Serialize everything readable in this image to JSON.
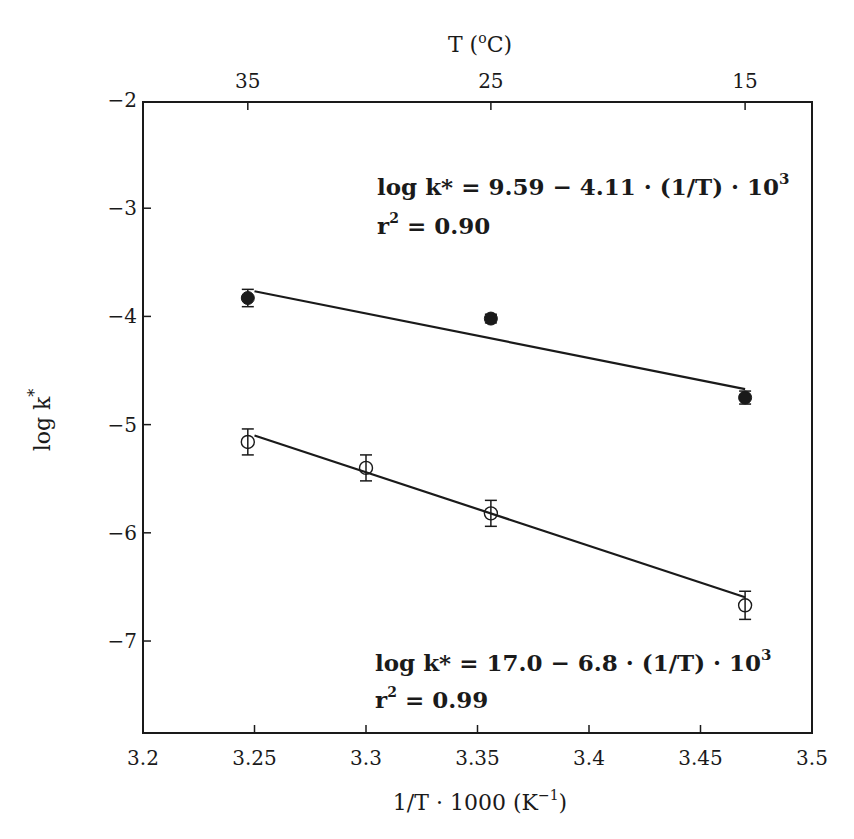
{
  "chart_data": {
    "type": "scatter",
    "title": "",
    "xlabel": "1/T · 1000 (K⁻¹)",
    "xlabel_parts": {
      "main": "1/T · 1000 (K",
      "sup": "−1",
      "tail": ")"
    },
    "ylabel": "log k*",
    "ylabel_parts": {
      "main": "log k",
      "sup": "*"
    },
    "top_xlabel": "T (°C)",
    "top_xlabel_parts": {
      "pre": "T (",
      "sup": "o",
      "post": "C)"
    },
    "xlim": [
      3.2,
      3.5
    ],
    "ylim": [
      -7.85,
      -2
    ],
    "grid": false,
    "x_ticks": [
      3.2,
      3.25,
      3.3,
      3.35,
      3.4,
      3.45,
      3.5
    ],
    "x_tick_labels": [
      "3.2",
      "3.25",
      "3.3",
      "3.35",
      "3.4",
      "3.45",
      "3.5"
    ],
    "y_ticks": [
      -2,
      -3,
      -4,
      -5,
      -6,
      -7
    ],
    "y_tick_labels": [
      "−2",
      "−3",
      "−4",
      "−5",
      "−6",
      "−7"
    ],
    "top_ticks": [
      {
        "x": 3.247,
        "label": "35"
      },
      {
        "x": 3.356,
        "label": "25"
      },
      {
        "x": 3.47,
        "label": "15"
      }
    ],
    "series": [
      {
        "name": "filled circles",
        "marker": "filled-circle",
        "x": [
          3.247,
          3.356,
          3.47
        ],
        "y": [
          -3.83,
          -4.02,
          -4.75
        ],
        "yerr": [
          0.08,
          0.04,
          0.06
        ],
        "fit": {
          "intercept": 9.59,
          "slope": -4.11,
          "r2": 0.9,
          "x_range": [
            3.25,
            3.47
          ]
        },
        "annotation": {
          "equation": "log  k* =  9.59  −  4.11 · (1/T) · 10",
          "equation_sup": "3",
          "r2_prefix": "r",
          "r2_sup": "2",
          "r2_value": " =  0.90"
        }
      },
      {
        "name": "open circles",
        "marker": "open-circle",
        "x": [
          3.247,
          3.3,
          3.356,
          3.47
        ],
        "y": [
          -5.16,
          -5.4,
          -5.82,
          -6.67
        ],
        "yerr": [
          0.12,
          0.12,
          0.12,
          0.13
        ],
        "fit": {
          "intercept": 17.0,
          "slope": -6.8,
          "r2": 0.99,
          "x_range": [
            3.25,
            3.47
          ]
        },
        "annotation": {
          "equation": "log  k* =  17.0  −  6.8   · (1/T) · 10",
          "equation_sup": "3",
          "r2_prefix": "r",
          "r2_sup": "2",
          "r2_value": " =  0.99"
        }
      }
    ],
    "colors": {
      "ink": "#1a1a1a",
      "background": "#ffffff"
    }
  }
}
